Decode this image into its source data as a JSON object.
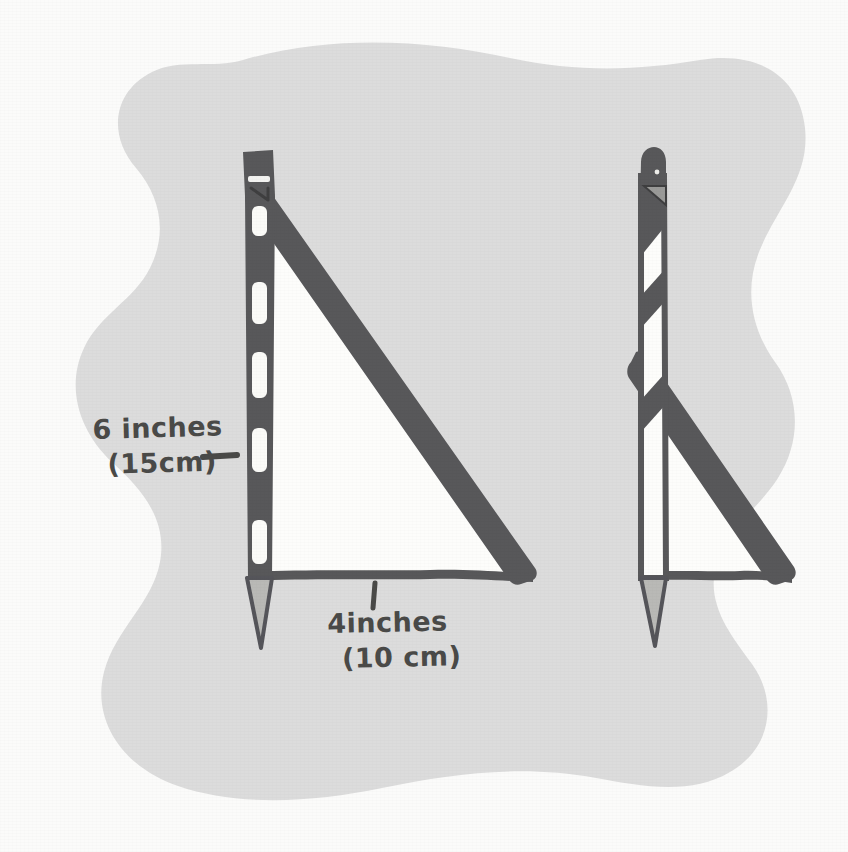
{
  "diagram": {
    "medium": "pencil sketch on paper",
    "background_blob_color": "#dcdcdc",
    "paper_color": "#fbfbfa",
    "ink_color": "#58585a",
    "text_color": "#4a4a48",
    "fill_color": "#fdfdfb"
  },
  "annotations": {
    "vertical_measure": {
      "imperial": "6 inches",
      "metric": "(15cm)",
      "leader": "dash-leader-right"
    },
    "horizontal_measure": {
      "imperial": "4inches",
      "metric": "(10 cm)",
      "leader": "tick-leader-up"
    }
  },
  "figures": [
    {
      "name": "front-view-triangle",
      "description": "pencil standing vertically forming the vertical leg of a right triangle with a thick diagonal hypotenuse and thin baseline",
      "parts": [
        "pencil-body-vertical",
        "pencil-eraser-cap",
        "pencil-sharpened-tip",
        "scale-notch-marks",
        "hypotenuse-diagonal",
        "baseline-horizontal",
        "triangle-interior-fill"
      ],
      "notch_count": 5
    },
    {
      "name": "side-view-triangle",
      "description": "same pencil seen edge-on with diagonal banding, thick diagonal stroke and baseline forming a narrower right triangle",
      "parts": [
        "pencil-body-vertical",
        "pencil-rounded-cap",
        "pencil-cap-notch",
        "pencil-sharpened-tip",
        "diagonal-band-marks",
        "hypotenuse-diagonal",
        "baseline-horizontal",
        "triangle-interior-fill"
      ],
      "band_count": 3
    }
  ],
  "colors": {
    "blob": "#dcdcdc",
    "ink": "#58585a",
    "ink_dark": "#4a4a4c",
    "paper": "#fbfbfa",
    "fill_white": "#fdfdfb"
  }
}
